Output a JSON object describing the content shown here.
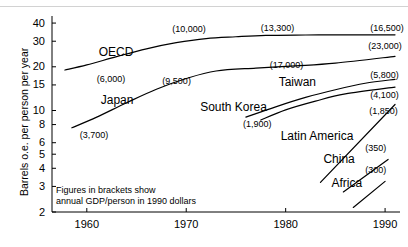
{
  "chart_data": {
    "type": "line",
    "title": "",
    "xlabel": "",
    "ylabel": "Barrels o.e. per person per year",
    "yscale": "log",
    "ylim": [
      2,
      42
    ],
    "xlim": [
      1956.5,
      1991.5
    ],
    "grid": false,
    "legend": "inline-labels",
    "yticks": [
      40,
      30,
      20,
      15,
      10,
      8,
      6,
      5,
      4,
      3,
      2
    ],
    "ytick_labels": [
      "40",
      "30",
      "20",
      "15",
      "10",
      "8",
      "6",
      "5",
      "4",
      "3",
      "2"
    ],
    "xticks": [
      1960,
      1970,
      1980,
      1990
    ],
    "xtick_labels": [
      "1960",
      "1970",
      "1980",
      "1990"
    ],
    "annotation": "Figures in brackets show\nannual GDP/person in 1990 dollars",
    "annotation_line1": "Figures in brackets show",
    "annotation_line2": "annual GDP/person in 1990 dollars",
    "series": [
      {
        "name": "OECD",
        "label": "OECD",
        "label_x": 1961.2,
        "label_y": 25.0,
        "start_gdp": "(6,000)",
        "mid_gdp": "(10,000)",
        "end_gdp": "(16,500)",
        "x": [
          1957.8,
          1960,
          1963,
          1966,
          1969,
          1972,
          1975,
          1978,
          1982,
          1986,
          1991
        ],
        "y": [
          19.0,
          20.6,
          23.5,
          26.6,
          29.3,
          31.3,
          32.2,
          32.9,
          33.1,
          33.2,
          33.2
        ]
      },
      {
        "name": "Japan",
        "label": "Japan",
        "label_x": 1961.4,
        "label_y": 11.6,
        "start_gdp": "(3,700)",
        "mid_gdp": "(9,500)",
        "end_gdp": "(23,000)",
        "x": [
          1958.5,
          1961,
          1964,
          1967,
          1970,
          1973,
          1977,
          1981,
          1985,
          1991
        ],
        "y": [
          7.6,
          9.0,
          11.3,
          14.0,
          16.6,
          18.7,
          19.6,
          20.3,
          21.2,
          23.6
        ]
      },
      {
        "name": "South Korea",
        "label": "South Korea",
        "label_x": 1971.4,
        "label_y": 10.4,
        "start_gdp": "(1,900)",
        "end_gdp": "(5,800)",
        "x": [
          1976.0,
          1979,
          1982,
          1985,
          1988,
          1991
        ],
        "y": [
          9.0,
          10.6,
          12.3,
          13.9,
          15.4,
          16.4
        ]
      },
      {
        "name": "Taiwan",
        "label": "Taiwan",
        "label_x": 1979.3,
        "label_y": 15.5,
        "mid_gdp": "(17,000)",
        "end_gdp": "(4,100)",
        "x": [
          1977.5,
          1980,
          1983,
          1986,
          1991
        ],
        "y": [
          8.6,
          10.1,
          11.6,
          13.0,
          14.5
        ]
      },
      {
        "name": "Latin America",
        "label": "Latin America",
        "label_x": 1979.5,
        "label_y": 6.6,
        "end_gdp": "(1,850)",
        "x": [
          1983.5,
          1991
        ],
        "y": [
          3.2,
          11.0
        ]
      },
      {
        "name": "China",
        "label": "China",
        "label_x": 1983.8,
        "label_y": 4.55,
        "end_gdp": "(350)",
        "x": [
          1985.8,
          1990.3
        ],
        "y": [
          2.75,
          4.6
        ]
      },
      {
        "name": "Africa",
        "label": "Africa",
        "label_x": 1984.6,
        "label_y": 3.1,
        "end_gdp": "(300)",
        "x": [
          1986.8,
          1990.0
        ],
        "y": [
          2.15,
          3.25
        ]
      }
    ],
    "gdp_annotations": [
      {
        "text": "(6,000)",
        "x": 1961.0,
        "y": 16.1,
        "series": "OECD"
      },
      {
        "text": "(10,000)",
        "x": 1968.6,
        "y": 36.0,
        "series": "OECD"
      },
      {
        "text": "(13,300)",
        "x": 1977.5,
        "y": 36.2,
        "series": "OECD"
      },
      {
        "text": "(16,500)",
        "x": 1988.5,
        "y": 36.2,
        "series": "OECD"
      },
      {
        "text": "(3,700)",
        "x": 1959.3,
        "y": 6.7,
        "series": "Japan"
      },
      {
        "text": "(9,500)",
        "x": 1967.6,
        "y": 15.6,
        "series": "Japan"
      },
      {
        "text": "(17,000)",
        "x": 1978.4,
        "y": 20.3,
        "series": "Japan"
      },
      {
        "text": "(23,000)",
        "x": 1988.3,
        "y": 27.3,
        "series": "Japan"
      },
      {
        "text": "(1,900)",
        "x": 1975.7,
        "y": 8.0,
        "series": "South Korea"
      },
      {
        "text": "(5,800)",
        "x": 1988.5,
        "y": 17.3,
        "series": "South Korea"
      },
      {
        "text": "(4,100)",
        "x": 1988.5,
        "y": 12.6,
        "series": "Taiwan"
      },
      {
        "text": "(1,850)",
        "x": 1988.4,
        "y": 9.8,
        "series": "Latin America"
      },
      {
        "text": "(350)",
        "x": 1988.0,
        "y": 5.45,
        "series": "China"
      },
      {
        "text": "(300)",
        "x": 1988.0,
        "y": 3.85,
        "series": "Africa"
      }
    ],
    "colors": {
      "line": "#000000",
      "axis": "#000000",
      "text": "#000000",
      "background": "#ffffff",
      "top_rule": "#d2d2d2"
    }
  }
}
